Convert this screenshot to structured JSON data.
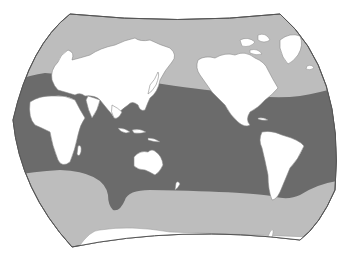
{
  "map": {
    "type": "world-map",
    "projection": "pacific-centered interrupted-style ellipse",
    "colors": {
      "background": "#ffffff",
      "outer_ocean": "#bdbdbd",
      "highlight_zone": "#6b6b6b",
      "land": "#ffffff",
      "border": "#8a8a8a",
      "outline": "#555555"
    },
    "legend": [],
    "labels": []
  }
}
